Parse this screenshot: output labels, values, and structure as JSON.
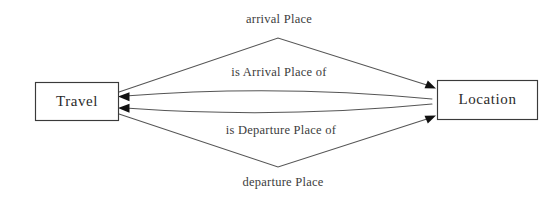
{
  "diagram": {
    "type": "entity-relationship",
    "background_color": "#ffffff",
    "line_color": "#555555",
    "text_color": "#3c3c3c",
    "box_border_color": "#3a3a3a",
    "entities": [
      {
        "id": "travel",
        "label": "Travel"
      },
      {
        "id": "location",
        "label": "Location"
      }
    ],
    "relations": [
      {
        "id": "arrival-place",
        "label": "arrival Place",
        "from": "Travel",
        "to": "Location",
        "direction": "right",
        "position": "top-outer"
      },
      {
        "id": "is-arrival-place-of",
        "label": "is Arrival Place of",
        "from": "Location",
        "to": "Travel",
        "direction": "left",
        "position": "top-inner"
      },
      {
        "id": "is-departure-place-of",
        "label": "is Departure Place of",
        "from": "Location",
        "to": "Travel",
        "direction": "left",
        "position": "bottom-inner"
      },
      {
        "id": "departure-place",
        "label": "departure Place",
        "from": "Travel",
        "to": "Location",
        "direction": "right",
        "position": "bottom-outer"
      }
    ]
  }
}
